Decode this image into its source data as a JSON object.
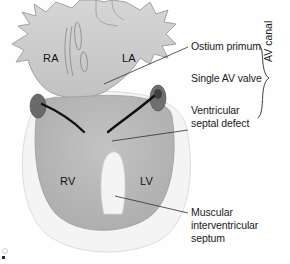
{
  "figure": {
    "type": "anatomical-illustration"
  },
  "chambers": [
    {
      "id": "right-atrium",
      "label": "RA",
      "x": 43,
      "y": 52
    },
    {
      "id": "left-atrium",
      "label": "LA",
      "x": 122,
      "y": 52
    },
    {
      "id": "right-ventricle",
      "label": "RV",
      "x": 60,
      "y": 175
    },
    {
      "id": "left-ventricle",
      "label": "LV",
      "x": 140,
      "y": 175
    }
  ],
  "annotations": [
    {
      "id": "ostium-primum",
      "lines": [
        "Ostium primum"
      ],
      "x": 191,
      "y": 46
    },
    {
      "id": "single-av-valve",
      "lines": [
        "Single AV valve"
      ],
      "x": 191,
      "y": 78
    },
    {
      "id": "ventricular-septal-defect",
      "lines": [
        "Ventricular",
        "septal defect"
      ],
      "x": 191,
      "y": 108
    },
    {
      "id": "muscular-septum",
      "lines": [
        "Muscular",
        "interventricular",
        "septum"
      ],
      "x": 191,
      "y": 211
    }
  ],
  "brace": {
    "id": "av-canal-brace",
    "label": "AV canal"
  },
  "colors": {
    "ink": "#1a1a1a",
    "leader": "#2e2e2e",
    "myocardium_light": "#f2f2f2",
    "chamber_fill": "#b9b9b9",
    "atrium_fill": "#cccccc",
    "valve_dark": "#141414",
    "valve_blob": "#5c5c5c",
    "outline": "#8c8c8c",
    "background": "#fefefe"
  }
}
